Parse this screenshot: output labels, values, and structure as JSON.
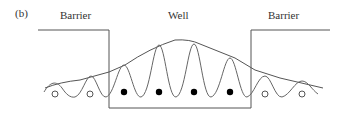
{
  "figure": {
    "panel_label": "(b)",
    "labels": {
      "left_region": "Barrier",
      "center_region": "Well",
      "right_region": "Barrier"
    },
    "colors": {
      "line": "#555555",
      "wave": "#666666",
      "filled_dot": "#000000",
      "open_circle_stroke": "#555555"
    },
    "particles": {
      "open_circles_count": 4,
      "filled_dots_count": 4
    }
  }
}
